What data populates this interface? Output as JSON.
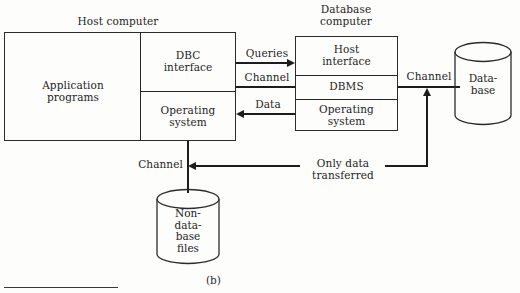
{
  "figure": {
    "caption": "(b)",
    "host_title": "Host computer",
    "db_title": "Database\ncomputer"
  },
  "host_computer": {
    "application_programs": "Application\nprograms",
    "dbc_interface": "DBC\ninterface",
    "operating_system": "Operating\nsystem"
  },
  "database_computer": {
    "host_interface": "Host\ninterface",
    "dbms": "DBMS",
    "operating_system": "Operating\nsystem"
  },
  "storage": {
    "database": "Data-\nbase",
    "non_database_files": "Non-\ndata-\nbase\nfiles"
  },
  "connections": {
    "queries": "Queries",
    "channel_host_db": "Channel",
    "data": "Data",
    "channel_db_storage": "Channel",
    "channel_host_files": "Channel",
    "only_data_transferred": "Only data\ntransferred"
  },
  "colors": {
    "ink": "#262626",
    "paper": "#fdfdfb"
  }
}
